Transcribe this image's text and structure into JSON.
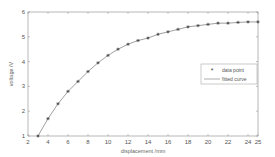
{
  "chart_data": {
    "type": "line",
    "title": "",
    "xlabel": "displacement /mm",
    "ylabel": "voltage /V",
    "xlim": [
      2,
      25
    ],
    "ylim": [
      1,
      6
    ],
    "x_ticks": [
      2,
      4,
      6,
      8,
      10,
      12,
      14,
      16,
      18,
      20,
      22,
      24,
      25
    ],
    "y_ticks": [
      1,
      2,
      3,
      4,
      5,
      6
    ],
    "grid": false,
    "legend_position": "right-center",
    "series": [
      {
        "name": "data point",
        "style": "markers",
        "marker": "star",
        "x": [
          3,
          4,
          5,
          6,
          7,
          8,
          9,
          10,
          11,
          12,
          13,
          14,
          15,
          16,
          17,
          18,
          19,
          20,
          21,
          22,
          23,
          24,
          25
        ],
        "values": [
          1.0,
          1.7,
          2.3,
          2.8,
          3.2,
          3.6,
          3.95,
          4.25,
          4.5,
          4.7,
          4.85,
          4.95,
          5.1,
          5.2,
          5.3,
          5.4,
          5.45,
          5.5,
          5.55,
          5.55,
          5.58,
          5.6,
          5.6
        ]
      },
      {
        "name": "fitted curve",
        "style": "line",
        "x": [
          3,
          4,
          5,
          6,
          7,
          8,
          9,
          10,
          11,
          12,
          13,
          14,
          15,
          16,
          17,
          18,
          19,
          20,
          21,
          22,
          23,
          24,
          25
        ],
        "values": [
          1.0,
          1.7,
          2.3,
          2.8,
          3.2,
          3.6,
          3.95,
          4.25,
          4.5,
          4.7,
          4.85,
          4.95,
          5.1,
          5.2,
          5.3,
          5.4,
          5.45,
          5.5,
          5.55,
          5.55,
          5.58,
          5.6,
          5.6
        ]
      }
    ]
  },
  "colors": {
    "axis": "#888888",
    "line": "#777777",
    "marker": "#444444",
    "text": "#555555"
  },
  "labels": {
    "xlabel": "displacement /mm",
    "ylabel": "voltage /V",
    "legend_points": "data point",
    "legend_line": "fitted curve"
  }
}
